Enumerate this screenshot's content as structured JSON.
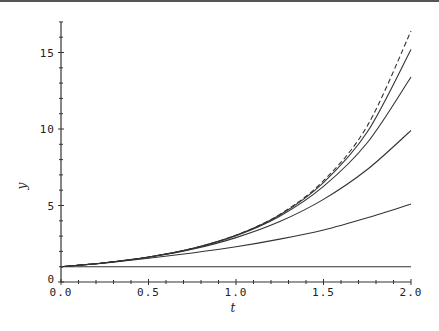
{
  "chart_data": {
    "type": "line",
    "title": "",
    "xlabel": "t",
    "ylabel": "y",
    "xlim": [
      0,
      2.0
    ],
    "ylim": [
      0,
      17
    ],
    "x_ticks": [
      "0.0",
      "0.5",
      "1.0",
      "1.5",
      "2.0"
    ],
    "y_ticks": [
      "0",
      "5",
      "10",
      "15"
    ],
    "grid": false,
    "legend": null,
    "x": [
      0,
      0.25,
      0.5,
      0.75,
      1.0,
      1.25,
      1.5,
      1.75,
      2.0
    ],
    "series": [
      {
        "name": "exact (dashed)",
        "style": "dashed",
        "values": [
          1,
          1.255,
          1.63,
          2.19,
          3.06,
          4.42,
          6.62,
          10.2,
          16.4
        ]
      },
      {
        "name": "approx 5",
        "style": "solid",
        "values": [
          1,
          1.255,
          1.63,
          2.19,
          3.05,
          4.38,
          6.5,
          9.8,
          15.2
        ]
      },
      {
        "name": "approx 4",
        "style": "solid",
        "values": [
          1,
          1.255,
          1.63,
          2.18,
          3.02,
          4.3,
          6.25,
          9.1,
          13.4
        ]
      },
      {
        "name": "approx 3",
        "style": "solid",
        "values": [
          1,
          1.25,
          1.62,
          2.14,
          2.9,
          3.95,
          5.4,
          7.35,
          9.9
        ]
      },
      {
        "name": "approx 2",
        "style": "solid",
        "values": [
          1,
          1.24,
          1.55,
          1.9,
          2.3,
          2.8,
          3.4,
          4.2,
          5.1
        ]
      },
      {
        "name": "approx 1",
        "style": "solid",
        "values": [
          1,
          1,
          1,
          1,
          1,
          1,
          1,
          1,
          1
        ]
      }
    ]
  },
  "axes": {
    "x_label": "t",
    "y_label": "y"
  },
  "colors": {
    "line": "#333333",
    "axis": "#333333"
  }
}
